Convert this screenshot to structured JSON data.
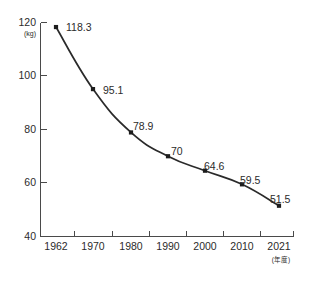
{
  "chart_data": {
    "type": "line",
    "title": "",
    "subtitle": "",
    "xlabel": "",
    "ylabel": "",
    "y_unit": "(kg)",
    "x_unit": "(年度)",
    "categories": [
      "1962",
      "1970",
      "1980",
      "1990",
      "2000",
      "2010",
      "2021"
    ],
    "x": [
      1962,
      1970,
      1980,
      1990,
      2000,
      2010,
      2021
    ],
    "values": [
      118.3,
      95.1,
      78.9,
      70,
      64.6,
      59.5,
      51.5
    ],
    "point_labels": [
      "118.3",
      "95.1",
      "78.9",
      "70",
      "64.6",
      "59.5",
      "51.5"
    ],
    "ylim": [
      40,
      120
    ],
    "yticks": [
      40,
      60,
      80,
      100,
      120
    ],
    "ytick_labels": [
      "40",
      "60",
      "80",
      "100",
      "120"
    ],
    "grid": false,
    "legend": null,
    "legend_position": "none",
    "marker": "square",
    "line_color": "#2a2a2a",
    "marker_color": "#1d1d1d",
    "axis_color": "#4a4a4a",
    "background_color": "#ffffff"
  },
  "axes": {
    "y_unit_caption": "(kg)",
    "x_unit_caption": "(年度)"
  }
}
